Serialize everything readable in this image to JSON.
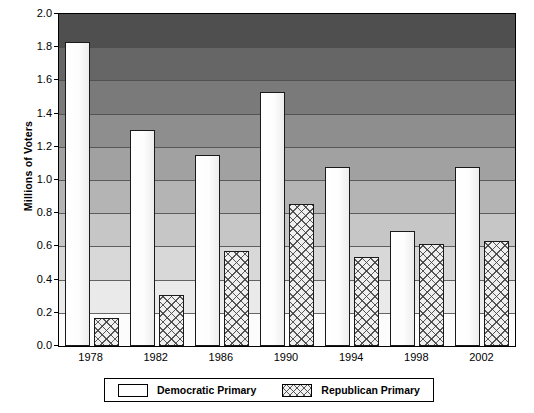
{
  "chart_data": {
    "type": "bar",
    "title": "",
    "xlabel": "",
    "ylabel": "Millions of Voters",
    "ylim": [
      0.0,
      2.0
    ],
    "ytick_labels": [
      "2.0",
      "1.8",
      "1.6",
      "1.4",
      "1.2",
      "1.0",
      "0.8",
      "0.6",
      "0.4",
      "0.2",
      "0.0"
    ],
    "ytick_values": [
      2.0,
      1.8,
      1.6,
      1.4,
      1.2,
      1.0,
      0.8,
      0.6,
      0.4,
      0.2,
      0.0
    ],
    "grid": true,
    "legend_position": "bottom",
    "categories": [
      "1978",
      "1982",
      "1986",
      "1990",
      "1994",
      "1998",
      "2002"
    ],
    "series": [
      {
        "name": "Democratic Primary",
        "fill": "#ffffff",
        "values": [
          1.83,
          1.3,
          1.15,
          1.53,
          1.08,
          0.69,
          1.08
        ]
      },
      {
        "name": "Republican Primary",
        "fill": "#f0f0f0",
        "values": [
          0.17,
          0.31,
          0.57,
          0.855,
          0.535,
          0.615,
          0.63
        ]
      }
    ]
  },
  "legend": {
    "entries": [
      {
        "label": "Democratic Primary"
      },
      {
        "label": "Republican Primary"
      }
    ]
  },
  "colors": {
    "plot_background_top": "#4f4f4f",
    "plot_background_bottom": "#fcfcfc",
    "axis": "#000000",
    "bar_border": "#1a1a1a"
  }
}
